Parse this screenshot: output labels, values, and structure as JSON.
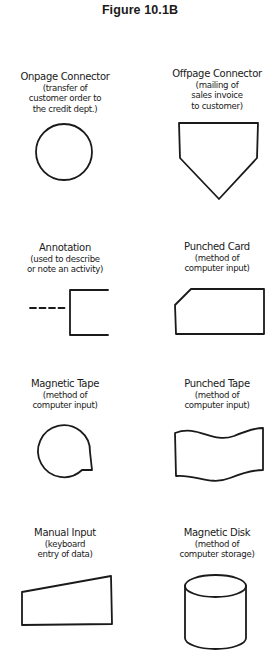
{
  "figure": {
    "title": "Figure 10.1B"
  },
  "symbols": [
    {
      "name": "Onpage Connector",
      "description": "(transfer of\ncustomer order to\nthe credit dept.)",
      "shape": "circle"
    },
    {
      "name": "Offpage Connector",
      "description": "(mailing of\nsales invoice\nto customer)",
      "shape": "pentagon-pointing-down"
    },
    {
      "name": "Annotation",
      "description": "(used to describe\nor note an activity)",
      "shape": "dashed-line-with-open-bracket"
    },
    {
      "name": "Punched Card",
      "description": "(method of\ncomputer input)",
      "shape": "rectangle-with-clipped-corner"
    },
    {
      "name": "Magnetic Tape",
      "description": "(method of\ncomputer input)",
      "shape": "circle-with-tail"
    },
    {
      "name": "Punched Tape",
      "description": "(method of\ncomputer input)",
      "shape": "wavy-rectangle"
    },
    {
      "name": "Manual Input",
      "description": "(keyboard\nentry of data)",
      "shape": "trapezoid-sloped-top"
    },
    {
      "name": "Magnetic Disk",
      "description": "(method of\ncomputer storage)",
      "shape": "cylinder"
    }
  ],
  "colors": {
    "ink": "#1a1a1a",
    "background": "#ffffff"
  }
}
